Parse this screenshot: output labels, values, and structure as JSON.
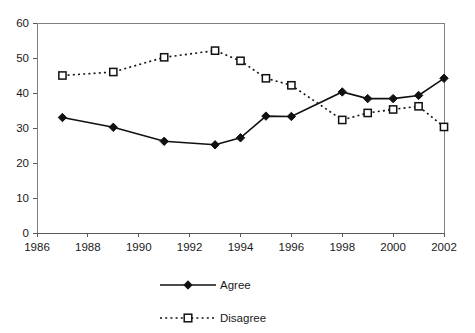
{
  "chart_data": {
    "type": "line",
    "title": "",
    "subtitle": "",
    "xlabel": "",
    "ylabel": "",
    "xlim": [
      1986,
      2002
    ],
    "ylim": [
      0,
      60
    ],
    "xticks": [
      1986,
      1988,
      1990,
      1992,
      1994,
      1996,
      1998,
      2000,
      2002
    ],
    "yticks": [
      0,
      10,
      20,
      30,
      40,
      50,
      60
    ],
    "xtick_labels": [
      "1986",
      "1988",
      "1990",
      "1992",
      "1994",
      "1996",
      "1998",
      "2000",
      "2002"
    ],
    "ytick_labels": [
      "0",
      "10",
      "20",
      "30",
      "40",
      "50",
      "60"
    ],
    "grid": false,
    "legend_position": "bottom-center",
    "x": [
      1987,
      1989,
      1991,
      1993,
      1994,
      1995,
      1996,
      1998,
      1999,
      2000,
      2001,
      2002
    ],
    "series": [
      {
        "name": "Agree",
        "marker": "filled-diamond",
        "linestyle": "solid",
        "color": "#111111",
        "values": [
          33,
          30.2,
          26.2,
          25.2,
          27.2,
          33.4,
          33.3,
          40.3,
          38.4,
          38.4,
          39.3,
          44.2
        ]
      },
      {
        "name": "Disagree",
        "marker": "open-square",
        "linestyle": "dotted",
        "color": "#111111",
        "values": [
          45,
          46,
          50.2,
          52.1,
          49.2,
          44.2,
          42.2,
          32.3,
          34.3,
          35.3,
          36.2,
          30.3
        ]
      }
    ]
  },
  "legend": {
    "items": [
      {
        "label": "Agree",
        "marker": "filled-diamond",
        "linestyle": "solid"
      },
      {
        "label": "Disagree",
        "marker": "open-square",
        "linestyle": "dotted"
      }
    ]
  }
}
